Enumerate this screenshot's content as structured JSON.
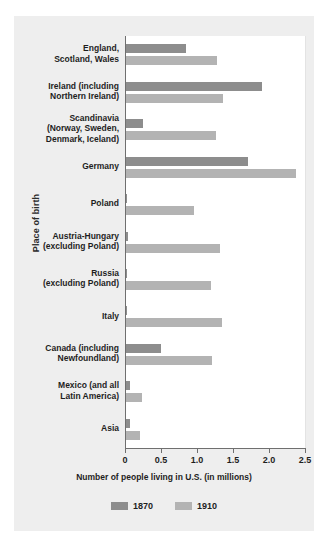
{
  "chart_data": {
    "type": "bar",
    "orientation": "horizontal",
    "title": "",
    "xlabel": "Number of people living in U.S. (in millions)",
    "ylabel": "Place of birth",
    "xlim": [
      0,
      2.5
    ],
    "xticks": [
      "0",
      "0.5",
      "1.0",
      "1.5",
      "2.0",
      "2.5"
    ],
    "xtick_values": [
      0,
      0.5,
      1.0,
      1.5,
      2.0,
      2.5
    ],
    "grid": false,
    "legend_position": "bottom",
    "categories": [
      "England,\nScotland, Wales",
      "Ireland (including\nNorthern Ireland)",
      "Scandinavia\n(Norway, Sweden,\nDenmark, Iceland)",
      "Germany",
      "Poland",
      "Austria-Hungary\n(excluding Poland)",
      "Russia\n(excluding Poland)",
      "Italy",
      "Canada (including\nNewfoundland)",
      "Mexico (and all\nLatin America)",
      "Asia"
    ],
    "series": [
      {
        "name": "1870",
        "color": "#8d8d8d",
        "values": [
          0.83,
          1.89,
          0.24,
          1.69,
          0.01,
          0.03,
          0.01,
          0.02,
          0.49,
          0.05,
          0.06
        ]
      },
      {
        "name": "1910",
        "color": "#b3b3b3",
        "values": [
          1.27,
          1.35,
          1.25,
          2.36,
          0.94,
          1.3,
          1.18,
          1.34,
          1.2,
          0.22,
          0.19
        ]
      }
    ]
  },
  "legend": {
    "items": [
      {
        "label": "1870",
        "color": "#8d8d8d"
      },
      {
        "label": "1910",
        "color": "#b3b3b3"
      }
    ]
  },
  "colors": {
    "panel_background": "#eeeeee",
    "plot_background": "#ffffff",
    "axis": "#6f6f6f",
    "series_1870": "#8d8d8d",
    "series_1910": "#b3b3b3"
  }
}
